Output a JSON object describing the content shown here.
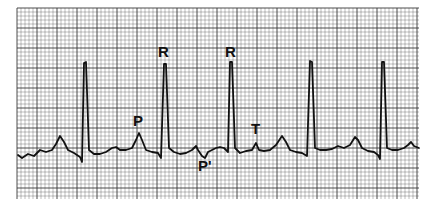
{
  "figure": {
    "type": "ECG rhythm strip",
    "paper_color": "#ffffff",
    "grid_color": "#3a3a3a",
    "trace_color": "#111111",
    "grid": {
      "x0": 17,
      "y0": 8,
      "x1": 419,
      "y1": 199,
      "minor": 4,
      "major_every": 5
    },
    "labels": [
      {
        "id": "R1",
        "text": "R",
        "x": 158,
        "y": 44
      },
      {
        "id": "R2",
        "text": "R",
        "x": 225,
        "y": 44
      },
      {
        "id": "P",
        "text": "P",
        "x": 133,
        "y": 113
      },
      {
        "id": "Pprime",
        "text": "P'",
        "x": 198,
        "y": 158
      },
      {
        "id": "T",
        "text": "T",
        "x": 251,
        "y": 121
      }
    ]
  },
  "chart_data": {
    "type": "line",
    "title": "",
    "annotations": [
      "R",
      "R",
      "P",
      "P'",
      "T"
    ],
    "trace_points": [
      [
        18,
        155
      ],
      [
        22,
        158
      ],
      [
        28,
        154
      ],
      [
        34,
        156
      ],
      [
        40,
        150
      ],
      [
        46,
        152
      ],
      [
        52,
        150
      ],
      [
        56,
        144
      ],
      [
        60,
        136
      ],
      [
        64,
        142
      ],
      [
        68,
        150
      ],
      [
        74,
        153
      ],
      [
        80,
        157
      ],
      [
        82,
        162
      ],
      [
        84,
        63
      ],
      [
        86,
        62
      ],
      [
        89,
        150
      ],
      [
        94,
        154
      ],
      [
        100,
        154
      ],
      [
        106,
        152
      ],
      [
        112,
        148
      ],
      [
        116,
        147
      ],
      [
        120,
        150
      ],
      [
        126,
        150
      ],
      [
        132,
        148
      ],
      [
        136,
        140
      ],
      [
        139,
        133
      ],
      [
        142,
        140
      ],
      [
        146,
        150
      ],
      [
        152,
        152
      ],
      [
        158,
        153
      ],
      [
        161,
        158
      ],
      [
        164,
        64
      ],
      [
        166,
        64
      ],
      [
        169,
        148
      ],
      [
        174,
        152
      ],
      [
        180,
        154
      ],
      [
        186,
        153
      ],
      [
        192,
        150
      ],
      [
        196,
        146
      ],
      [
        198,
        150
      ],
      [
        202,
        156
      ],
      [
        205,
        158
      ],
      [
        208,
        152
      ],
      [
        212,
        150
      ],
      [
        216,
        148
      ],
      [
        220,
        147
      ],
      [
        224,
        148
      ],
      [
        228,
        152
      ],
      [
        230,
        62
      ],
      [
        232,
        62
      ],
      [
        235,
        148
      ],
      [
        240,
        153
      ],
      [
        246,
        151
      ],
      [
        252,
        150
      ],
      [
        256,
        143
      ],
      [
        259,
        150
      ],
      [
        264,
        151
      ],
      [
        270,
        150
      ],
      [
        276,
        145
      ],
      [
        282,
        136
      ],
      [
        286,
        142
      ],
      [
        290,
        150
      ],
      [
        296,
        152
      ],
      [
        302,
        153
      ],
      [
        307,
        156
      ],
      [
        310,
        61
      ],
      [
        312,
        62
      ],
      [
        315,
        148
      ],
      [
        320,
        150
      ],
      [
        326,
        150
      ],
      [
        332,
        149
      ],
      [
        338,
        146
      ],
      [
        344,
        148
      ],
      [
        350,
        145
      ],
      [
        355,
        137
      ],
      [
        358,
        140
      ],
      [
        362,
        148
      ],
      [
        368,
        151
      ],
      [
        374,
        152
      ],
      [
        378,
        155
      ],
      [
        380,
        159
      ],
      [
        382,
        62
      ],
      [
        384,
        62
      ],
      [
        387,
        148
      ],
      [
        392,
        150
      ],
      [
        398,
        150
      ],
      [
        404,
        148
      ],
      [
        408,
        145
      ],
      [
        411,
        142
      ],
      [
        414,
        146
      ],
      [
        419,
        148
      ]
    ]
  }
}
